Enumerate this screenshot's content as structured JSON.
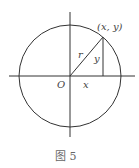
{
  "figure": {
    "caption": "图 5",
    "point_label": "(x, y)",
    "origin_label": "O",
    "radius_label": "r",
    "x_label": "x",
    "y_label": "y"
  },
  "geometry": {
    "center": [
      70,
      76
    ],
    "radius": 51,
    "point": [
      103,
      37
    ],
    "stroke_color": "#333333"
  }
}
